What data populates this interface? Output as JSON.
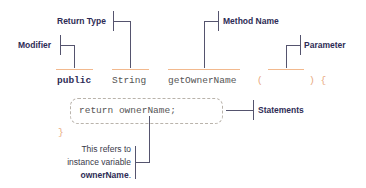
{
  "diagram": {
    "labels": {
      "modifier": "Modifier",
      "return_type": "Return Type",
      "method_name": "Method Name",
      "parameter": "Parameter",
      "statements": "Statements"
    },
    "code": {
      "modifier": "public",
      "return_type": "String",
      "method_name": "getOwnerName",
      "open_paren": "(",
      "close_paren_brace": ") {",
      "statement": "return ownerName;",
      "close_brace": "}"
    },
    "note": {
      "line1": "This refers to",
      "line2": "instance variable",
      "line3_bold": "ownerName",
      "line3_suffix": "."
    },
    "colors": {
      "label": "#2e2c55",
      "connector": "#55546e",
      "underline": "#f2b98e",
      "punctuation": "#e8a77a",
      "dashed_border": "#b9b3ab",
      "code_text": "#555555"
    }
  }
}
